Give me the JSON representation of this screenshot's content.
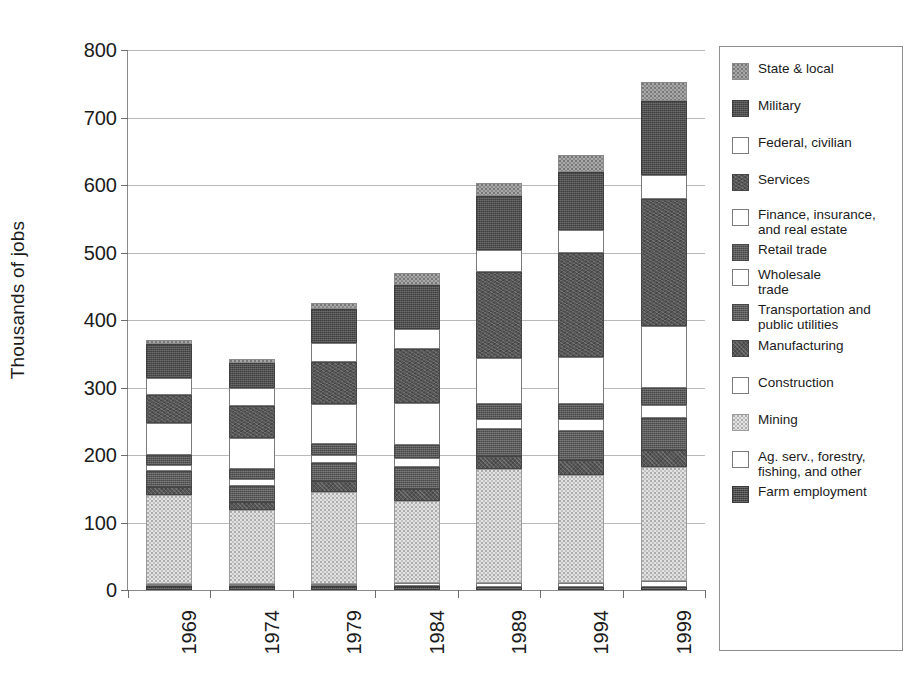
{
  "chart_data": {
    "type": "bar",
    "subtype": "stacked-bar",
    "title": "",
    "xlabel": "",
    "ylabel": "Thousands of jobs",
    "ylim": [
      0,
      800
    ],
    "ytick_step": 100,
    "yticks": [
      "800",
      "700",
      "600",
      "500",
      "400",
      "300",
      "200",
      "100",
      "0"
    ],
    "grid": true,
    "legend_position": "right",
    "categories": [
      "1969",
      "1974",
      "1979",
      "1984",
      "1989",
      "1994",
      "1999"
    ],
    "stack_order_bottom_to_top": [
      "Farm employment",
      "Ag. serv., forestry, fishing, and other",
      "Mining",
      "Construction",
      "Manufacturing",
      "Transportation and public utilities",
      "Wholesale trade",
      "Retail trade",
      "Finance, insurance, and real estate",
      "Services",
      "Federal, civilian",
      "Military",
      "State & local"
    ],
    "series": [
      {
        "name": "Farm employment",
        "key": "farm",
        "fill": "f-farm",
        "values": [
          6,
          6,
          6,
          6,
          5,
          5,
          5
        ]
      },
      {
        "name": "Ag. serv., forestry, fishing, and other",
        "key": "agserv",
        "fill": "f-agserv",
        "values": [
          2,
          2,
          3,
          4,
          5,
          6,
          8
        ]
      },
      {
        "name": "Mining",
        "key": "mining",
        "fill": "f-mining",
        "values": [
          132,
          110,
          136,
          122,
          170,
          159,
          169
        ]
      },
      {
        "name": "Construction",
        "key": "constr",
        "fill": "f-constr",
        "values": [
          0,
          0,
          0,
          0,
          0,
          0,
          0
        ]
      },
      {
        "name": "Manufacturing",
        "key": "manu",
        "fill": "f-manu",
        "values": [
          11,
          11,
          16,
          18,
          19,
          22,
          26
        ]
      },
      {
        "name": "Transportation and public utilities",
        "key": "trans",
        "fill": "f-trans",
        "values": [
          25,
          24,
          27,
          32,
          39,
          43,
          47
        ]
      },
      {
        "name": "Wholesale trade",
        "key": "whole",
        "fill": "f-whole",
        "values": [
          9,
          10,
          12,
          14,
          16,
          18,
          19
        ]
      },
      {
        "name": "Retail trade",
        "key": "retail",
        "fill": "f-retail",
        "values": [
          14,
          15,
          17,
          19,
          21,
          23,
          26
        ]
      },
      {
        "name": "Finance, insurance, and real estate",
        "key": "fire",
        "fill": "f-fire",
        "values": [
          48,
          46,
          59,
          62,
          69,
          69,
          91
        ]
      },
      {
        "name": "Services",
        "key": "serv",
        "fill": "f-serv",
        "values": [
          41,
          48,
          62,
          80,
          127,
          154,
          188
        ]
      },
      {
        "name": "Federal, civilian",
        "key": "fed",
        "fill": "f-fed",
        "values": [
          25,
          26,
          28,
          30,
          33,
          35,
          36
        ]
      },
      {
        "name": "Military",
        "key": "mil",
        "fill": "f-mil",
        "values": [
          50,
          38,
          51,
          65,
          80,
          85,
          110
        ]
      },
      {
        "name": "State & local",
        "key": "state",
        "fill": "f-state",
        "values": [
          7,
          5,
          8,
          18,
          19,
          26,
          27
        ]
      }
    ],
    "totals": [
      370,
      338,
      425,
      468,
      603,
      645,
      752
    ]
  },
  "legend": {
    "items": [
      {
        "label": "State & local",
        "fill": "f-state"
      },
      {
        "label": "Military",
        "fill": "f-mil"
      },
      {
        "label": "Federal, civilian",
        "fill": "f-fed"
      },
      {
        "label": "Services",
        "fill": "f-serv"
      },
      {
        "label": "Finance, insurance,\nand real estate",
        "fill": "f-fire"
      },
      {
        "label": "Retail trade",
        "fill": "f-retail"
      },
      {
        "label": "Wholesale\ntrade",
        "fill": "f-whole"
      },
      {
        "label": "Transportation and\npublic utilities",
        "fill": "f-trans"
      },
      {
        "label": "Manufacturing",
        "fill": "f-manu"
      },
      {
        "label": "Construction",
        "fill": "f-constr"
      },
      {
        "label": "Mining",
        "fill": "f-mining"
      },
      {
        "label": "Ag. serv., forestry,\nfishing, and other",
        "fill": "f-agserv"
      },
      {
        "label": "Farm employment",
        "fill": "f-farm"
      }
    ]
  },
  "colors": {
    "axis": "#6d6d6d",
    "grid": "#b9b9b9",
    "text": "#1b1b1b",
    "dark_fill": "#4f4f4f",
    "mid_fill": "#a8a8a8",
    "light_fill": "#e2e2e2",
    "empty_fill": "#ffffff"
  }
}
